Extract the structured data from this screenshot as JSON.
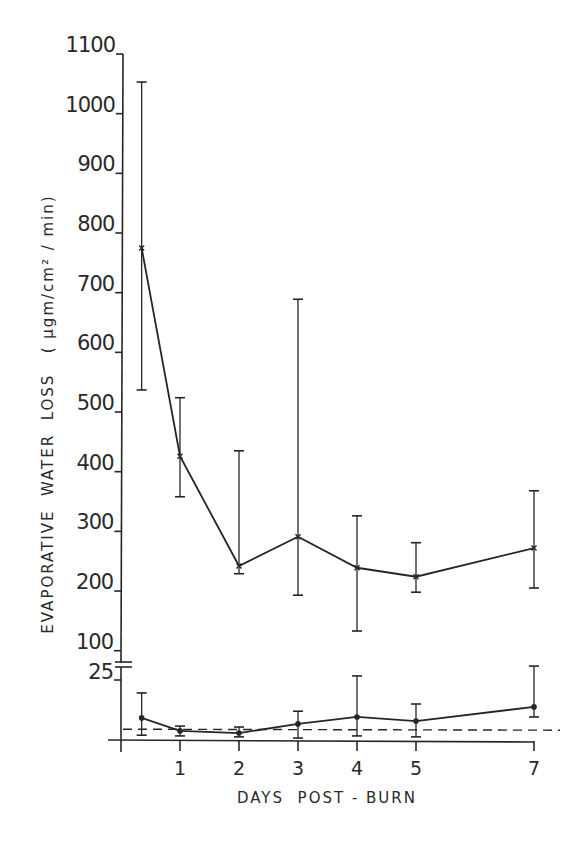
{
  "chart_data": {
    "type": "line",
    "title": "",
    "xlabel": "DAYS  POST - BURN",
    "ylabel": "EVAPORATIVE  WATER  LOSS   ( µgm/cm² / min)",
    "x_ticks": [
      1,
      2,
      3,
      4,
      5,
      7
    ],
    "y_axis_broken": true,
    "y_upper": {
      "ticks": [
        100,
        200,
        300,
        400,
        500,
        600,
        700,
        800,
        900,
        1000,
        1100
      ],
      "range": [
        100,
        1100
      ]
    },
    "y_lower": {
      "ticks": [
        25
      ],
      "range": [
        0,
        25
      ]
    },
    "grid": false,
    "legend": null,
    "series": [
      {
        "name": "Burned skin",
        "marker": "x",
        "axis": "upper",
        "x": [
          0.35,
          1,
          2,
          3,
          4,
          5,
          7
        ],
        "values": [
          775,
          426,
          242,
          291,
          239,
          224,
          272
        ],
        "error_high": [
          1053,
          524,
          435,
          689,
          326,
          281,
          368
        ],
        "error_low": [
          537,
          358,
          229,
          193,
          133,
          198,
          205
        ]
      },
      {
        "name": "Control (unburned) skin",
        "marker": "dot",
        "axis": "lower",
        "x": [
          0.35,
          1,
          2,
          3,
          4,
          5,
          7
        ],
        "values": [
          9.2,
          3.8,
          2.9,
          6.7,
          9.6,
          7.9,
          13.8
        ],
        "error_high": [
          19.6,
          5.8,
          5.4,
          12.0,
          26.7,
          15.0,
          30.8
        ],
        "error_low": [
          2.0,
          1.7,
          1.3,
          0.8,
          1.7,
          1.3,
          9.6
        ]
      }
    ],
    "reference_lines": [
      {
        "name": "normal baseline (dashed)",
        "axis": "lower",
        "value": 4.5,
        "style": "dashed"
      }
    ]
  },
  "labels": {
    "xlabel": "DAYS  POST - BURN",
    "ylabel": "EVAPORATIVE  WATER  LOSS   ( µgm/cm² / min)"
  }
}
